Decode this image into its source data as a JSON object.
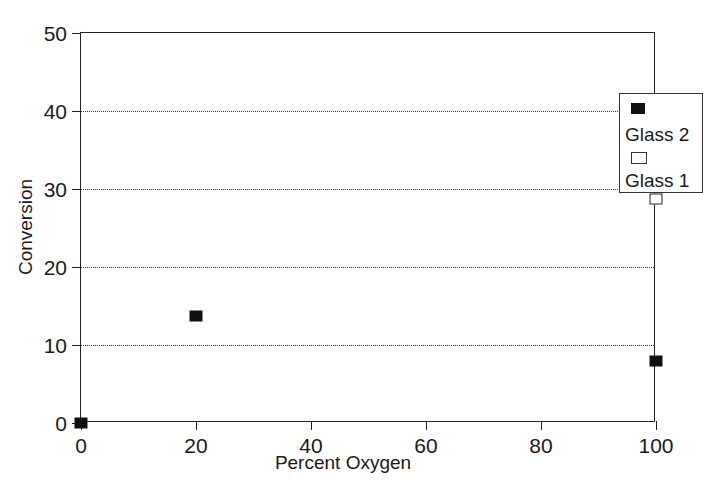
{
  "chart_data": {
    "type": "scatter",
    "title": "",
    "xlabel": "Percent Oxygen",
    "ylabel": "Conversion",
    "xlim": [
      0,
      100
    ],
    "ylim": [
      0,
      50
    ],
    "xticks": [
      0,
      20,
      40,
      60,
      80,
      100
    ],
    "yticks": [
      0,
      10,
      20,
      30,
      40,
      50
    ],
    "xtick_labels": [
      "0",
      "20",
      "40",
      "60",
      "80",
      "100"
    ],
    "ytick_labels": [
      "0",
      "10",
      "20",
      "30",
      "40",
      "50"
    ],
    "grid": "horizontal-dotted",
    "gridlines_y": [
      10,
      20,
      30,
      40
    ],
    "legend_position": "upper-right",
    "series": [
      {
        "name": "Glass 2",
        "marker": "filled-square",
        "color": "#111111",
        "points": [
          {
            "x": 0,
            "y": 0.0
          },
          {
            "x": 20,
            "y": 13.7
          },
          {
            "x": 100,
            "y": 8.0
          }
        ]
      },
      {
        "name": "Glass 1",
        "marker": "open-square",
        "color": "#ffffff",
        "points": [
          {
            "x": 100,
            "y": 28.7
          }
        ]
      }
    ]
  },
  "legend": {
    "entries": [
      {
        "label": "Glass 2",
        "marker": "filled-square"
      },
      {
        "label": "Glass 1",
        "marker": "open-square"
      }
    ]
  },
  "colors": {
    "background": "#ffffff",
    "axis": "#222222",
    "grid": "#333333",
    "text": "#1a1a1a",
    "marker_fill": "#111111"
  }
}
